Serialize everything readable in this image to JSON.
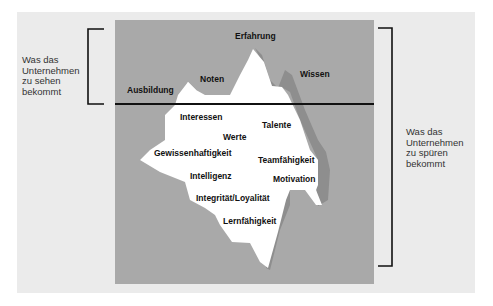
{
  "diagram": {
    "type": "iceberg-model",
    "colors": {
      "background": "#ebebeb",
      "sea": "#a9a9a9",
      "iceberg": "#ffffff",
      "shadow": "#8e8e8e",
      "lines": "#111111"
    },
    "visible_label": {
      "lines": [
        "Was das",
        "Unternehmen",
        "zu sehen",
        "bekommt"
      ]
    },
    "hidden_label": {
      "lines": [
        "Was das",
        "Unternehmen",
        "zu spüren",
        "bekommt"
      ]
    },
    "above_water": [
      {
        "text": "Erfahrung"
      },
      {
        "text": "Noten"
      },
      {
        "text": "Wissen"
      },
      {
        "text": "Ausbildung"
      }
    ],
    "below_water": [
      {
        "text": "Interessen"
      },
      {
        "text": "Talente"
      },
      {
        "text": "Werte"
      },
      {
        "text": "Gewissenhaftigkeit"
      },
      {
        "text": "Teamfähigkeit"
      },
      {
        "text": "Intelligenz"
      },
      {
        "text": "Motivation"
      },
      {
        "text": "Integrität/Loyalität"
      },
      {
        "text": "Lernfähigkeit"
      }
    ]
  }
}
